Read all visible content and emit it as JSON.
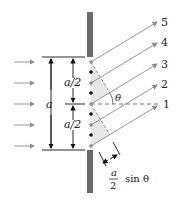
{
  "diagram": {
    "colors": {
      "barrier": "#6b6b6b",
      "ray": "#8a8a8a",
      "shade": "#e6e6e6",
      "text": "#222222",
      "dot_black": "#111111",
      "dot_gray": "#8a8a8a"
    },
    "labels": {
      "ray_1": "1",
      "ray_2": "2",
      "ray_3": "3",
      "ray_4": "4",
      "ray_5": "5",
      "slit_width": "a",
      "half_top": "a/2",
      "half_bottom": "a/2",
      "angle": "θ",
      "path_diff_num": "a",
      "path_diff_den": "2",
      "path_diff_fn": "sin θ"
    }
  }
}
